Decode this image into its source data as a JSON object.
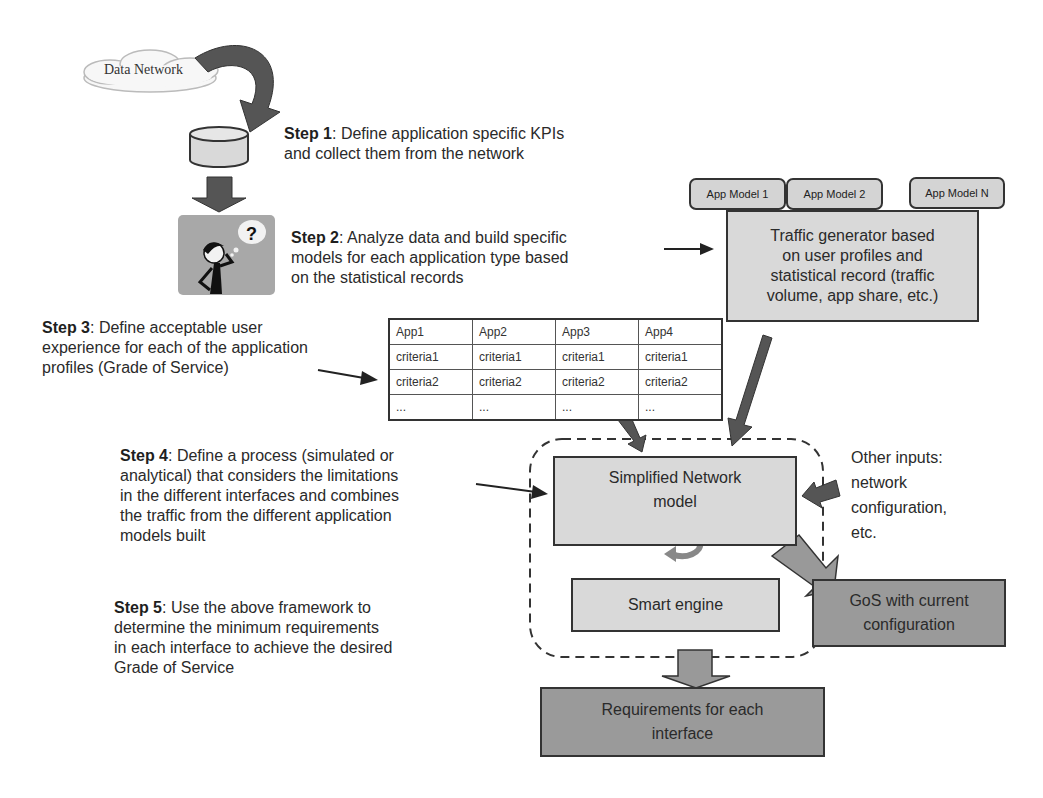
{
  "diagram": {
    "cloud_label": "Data Network",
    "steps": [
      {
        "label": "Step 1",
        "text": ": Define application specific KPIs",
        "text2": "and collect them from the network"
      },
      {
        "label": "Step 2",
        "text": ": Analyze data and build specific",
        "text2": "models for each application type based",
        "text3": "on the statistical records"
      },
      {
        "label": "Step 3",
        "text": ": Define acceptable user",
        "text2": "experience for each of the application",
        "text3": "profiles (Grade of Service)"
      },
      {
        "label": "Step 4",
        "text": ": Define a process (simulated or",
        "text2": "analytical) that considers the limitations",
        "text3": "in the different interfaces and combines",
        "text4": "the traffic from the different application",
        "text5": "models built"
      },
      {
        "label": "Step 5",
        "text": ": Use the above framework to",
        "text2": "determine the minimum requirements",
        "text3": "in each interface to achieve the desired",
        "text4": "Grade of Service"
      }
    ],
    "app_models": [
      "App Model 1",
      "App Model 2",
      "App Model N"
    ],
    "traffic_generator": {
      "line1": "Traffic generator based",
      "line2": "on user profiles and",
      "line3": "statistical record (traffic",
      "line4": "volume, app share, etc.)"
    },
    "criteria_table": {
      "headers": [
        "App1",
        "App2",
        "App3",
        "App4"
      ],
      "rows": [
        [
          "criteria1",
          "criteria1",
          "criteria1",
          "criteria1"
        ],
        [
          "criteria2",
          "criteria2",
          "criteria2",
          "criteria2"
        ],
        [
          "...",
          "...",
          "...",
          "..."
        ]
      ]
    },
    "network_model": {
      "line1": "Simplified Network",
      "line2": "model"
    },
    "smart_engine": "Smart engine",
    "other_inputs": {
      "line1": "Other inputs:",
      "line2": "network",
      "line3": "configuration,",
      "line4": "etc."
    },
    "gos_box": {
      "line1": "GoS with current",
      "line2": "configuration"
    },
    "requirements_box": {
      "line1": "Requirements for each",
      "line2": "interface"
    },
    "colors": {
      "light_box": "#d9d9d9",
      "dark_box": "#9a9a9a",
      "arrow": "#555555",
      "stroke": "#333333"
    }
  }
}
